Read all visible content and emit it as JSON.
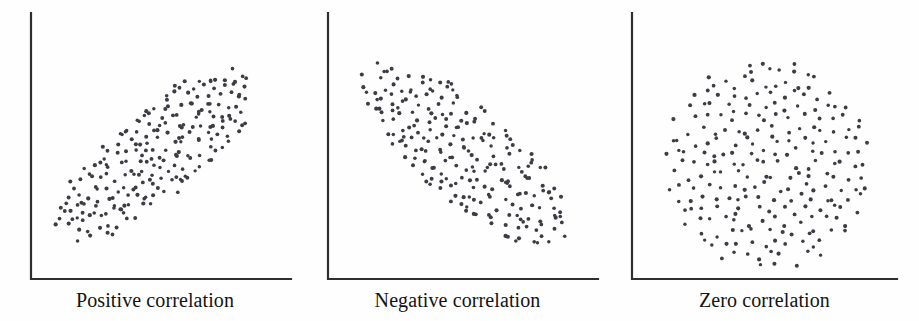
{
  "figure": {
    "width": 919,
    "height": 321,
    "background_color": "#fefefe",
    "axis_color": "#2f2f33",
    "dot_color": "#3c3c44",
    "caption_color": "#131313",
    "dot_radius": 1.9,
    "axis_stroke_width": 2.2
  },
  "chart_data": [
    {
      "type": "scatter",
      "title": "Positive correlation",
      "xlabel": "",
      "ylabel": "",
      "grid": false,
      "legend": "none",
      "axis_origin": [
        31,
        279
      ],
      "x_axis_end": [
        291,
        279
      ],
      "y_axis_end": [
        31,
        13
      ],
      "xlim": [
        0,
        260
      ],
      "ylim": [
        0,
        266
      ],
      "correlation": 0.92,
      "n_points": 240,
      "cloud": {
        "shape": "ellipse",
        "center_x": 157,
        "center_y": 154,
        "semi_major": 130,
        "semi_minor": 46,
        "angle_deg": -40,
        "jitter": 5.5,
        "seed": 1731
      },
      "description": "Dense elliptical cloud of points sloping upward from lower-left to upper-right"
    },
    {
      "type": "scatter",
      "title": "Negative correlation",
      "xlabel": "",
      "ylabel": "",
      "grid": false,
      "legend": "none",
      "axis_origin": [
        328,
        279
      ],
      "x_axis_end": [
        598,
        279
      ],
      "y_axis_end": [
        328,
        13
      ],
      "xlim": [
        0,
        270
      ],
      "ylim": [
        0,
        266
      ],
      "correlation": -0.88,
      "n_points": 232,
      "cloud": {
        "shape": "ellipse",
        "center_x": 466,
        "center_y": 155,
        "semi_major": 135,
        "semi_minor": 50,
        "angle_deg": 40,
        "jitter": 5.5,
        "seed": 5209
      },
      "description": "Dense elliptical cloud of points sloping downward from upper-left to lower-right"
    },
    {
      "type": "scatter",
      "title": "Zero correlation",
      "xlabel": "",
      "ylabel": "",
      "grid": false,
      "legend": "none",
      "axis_origin": [
        632,
        279
      ],
      "x_axis_end": [
        897,
        279
      ],
      "y_axis_end": [
        632,
        13
      ],
      "xlim": [
        0,
        265
      ],
      "ylim": [
        0,
        266
      ],
      "correlation": 0.0,
      "n_points": 238,
      "cloud": {
        "shape": "circle",
        "center_x": 768,
        "center_y": 164,
        "semi_major": 106,
        "semi_minor": 106,
        "angle_deg": 0,
        "jitter": 5.0,
        "seed": 9137
      },
      "description": "Dense circular cloud of points with no directional trend"
    }
  ],
  "panels": [
    {
      "name": "positive",
      "left": 0,
      "width": 310,
      "caption": "Positive correlation",
      "caption_top": 288
    },
    {
      "name": "negative",
      "left": 305,
      "width": 305,
      "caption": "Negative correlation",
      "caption_top": 288
    },
    {
      "name": "zero",
      "left": 610,
      "width": 309,
      "caption": "Zero correlation",
      "caption_top": 288
    }
  ]
}
